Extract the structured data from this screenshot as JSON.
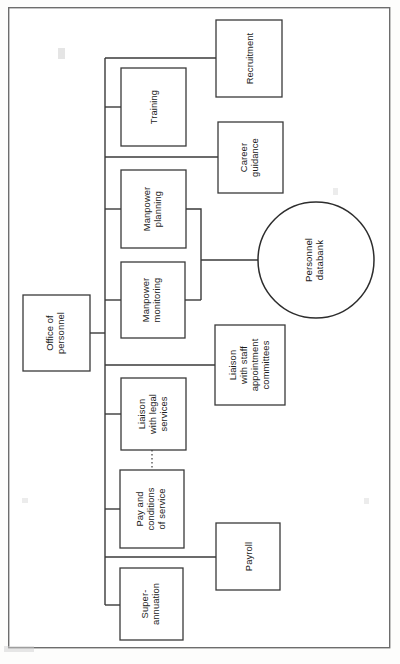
{
  "diagram": {
    "type": "organisation-chart",
    "orientation": "rotated-90-ccw",
    "frame": {
      "x": 8,
      "y": 7,
      "width": 382,
      "height": 641
    },
    "colors": {
      "page_background": "#fdfdfc",
      "node_fill": "#ffffff",
      "node_stroke": "#3a3a3a",
      "frame_stroke": "#6d6d6d",
      "link_stroke": "#3a3a3a",
      "text": "#1a1a1a"
    },
    "nodes": [
      {
        "id": "office-of-personnel",
        "label": "Office of\npersonnel",
        "lines": [
          "Office of",
          "personnel"
        ],
        "shape": "rect",
        "x": 23,
        "y": 295,
        "width": 67,
        "height": 76,
        "role": "root"
      },
      {
        "id": "training",
        "label": "Training",
        "lines": [
          "Training"
        ],
        "shape": "rect",
        "x": 121,
        "y": 68,
        "width": 65,
        "height": 78,
        "role": "division"
      },
      {
        "id": "recruitment",
        "label": "Recruitment",
        "lines": [
          "Recruitment"
        ],
        "shape": "rect",
        "x": 216,
        "y": 20,
        "width": 66,
        "height": 77,
        "role": "function"
      },
      {
        "id": "career-guidance",
        "label": "Career\nguidance",
        "lines": [
          "Career",
          "guidance"
        ],
        "shape": "rect",
        "x": 218,
        "y": 122,
        "width": 65,
        "height": 71,
        "role": "function"
      },
      {
        "id": "manpower-planning",
        "label": "Manpower\nplanning",
        "lines": [
          "Manpower",
          "planning"
        ],
        "shape": "rect",
        "x": 121,
        "y": 170,
        "width": 65,
        "height": 78,
        "role": "division"
      },
      {
        "id": "manpower-monitoring",
        "label": "Manpower\nmonitoring",
        "lines": [
          "Manpower",
          "monitoring"
        ],
        "shape": "rect",
        "x": 121,
        "y": 262,
        "width": 64,
        "height": 76,
        "role": "division"
      },
      {
        "id": "personnel-databank",
        "label": "Personnel\ndatabank",
        "lines": [
          "Personnel",
          "databank"
        ],
        "shape": "circle",
        "cx": 316,
        "cy": 260,
        "r": 58,
        "role": "datastore"
      },
      {
        "id": "liaison-with-staff-appointment-committees",
        "label": "Liaison\nwith staff\nappointment\ncommittees",
        "lines": [
          "Liaison",
          "with staff",
          "appointment",
          "committees"
        ],
        "shape": "rect",
        "x": 215,
        "y": 325,
        "width": 70,
        "height": 80,
        "role": "function"
      },
      {
        "id": "liaison-with-legal-services",
        "label": "Liaison\nwith legal\nservices",
        "lines": [
          "Liaison",
          "with legal",
          "services"
        ],
        "shape": "rect",
        "x": 121,
        "y": 378,
        "width": 65,
        "height": 72,
        "role": "division"
      },
      {
        "id": "pay-and-conditions-of-service",
        "label": "Pay and\nconditions\nof service",
        "lines": [
          "Pay and",
          "conditions",
          "of service"
        ],
        "shape": "rect",
        "x": 120,
        "y": 470,
        "width": 64,
        "height": 78,
        "role": "division"
      },
      {
        "id": "payroll",
        "label": "Payroll",
        "lines": [
          "Payroll"
        ],
        "shape": "rect",
        "x": 216,
        "y": 523,
        "width": 64,
        "height": 67,
        "role": "function"
      },
      {
        "id": "superannuation",
        "label": "Super-\nannuation",
        "lines": [
          "Super-",
          "annuation"
        ],
        "shape": "rect",
        "x": 120,
        "y": 568,
        "width": 63,
        "height": 72,
        "role": "division"
      }
    ],
    "links": [
      {
        "id": "link-root-to-trunk",
        "from": "office-of-personnel",
        "to": "trunk",
        "style": "solid"
      },
      {
        "id": "link-trunk-to-training",
        "from": "trunk",
        "to": "training",
        "style": "solid"
      },
      {
        "id": "link-trunk-to-recruitment",
        "from": "trunk",
        "to": "recruitment",
        "style": "solid"
      },
      {
        "id": "link-trunk-to-career-guidance",
        "from": "trunk",
        "to": "career-guidance",
        "style": "solid"
      },
      {
        "id": "link-trunk-to-manpower-planning",
        "from": "trunk",
        "to": "manpower-planning",
        "style": "solid"
      },
      {
        "id": "link-trunk-to-manpower-monitoring",
        "from": "trunk",
        "to": "manpower-monitoring",
        "style": "solid"
      },
      {
        "id": "link-manpower-to-databank",
        "from": "manpower-planning,manpower-monitoring",
        "to": "personnel-databank",
        "style": "solid"
      },
      {
        "id": "link-trunk-to-liaison-staff",
        "from": "trunk",
        "to": "liaison-with-staff-appointment-committees",
        "style": "solid"
      },
      {
        "id": "link-trunk-to-liaison-legal",
        "from": "trunk",
        "to": "liaison-with-legal-services",
        "style": "solid"
      },
      {
        "id": "link-trunk-to-pay-conditions",
        "from": "trunk",
        "to": "pay-and-conditions-of-service",
        "style": "solid"
      },
      {
        "id": "link-pay-to-legal-dotted",
        "from": "pay-and-conditions-of-service",
        "to": "liaison-with-legal-services",
        "style": "dotted"
      },
      {
        "id": "link-trunk-to-payroll",
        "from": "trunk",
        "to": "payroll",
        "style": "solid"
      },
      {
        "id": "link-trunk-to-superannuation",
        "from": "trunk",
        "to": "superannuation",
        "style": "solid"
      }
    ]
  }
}
